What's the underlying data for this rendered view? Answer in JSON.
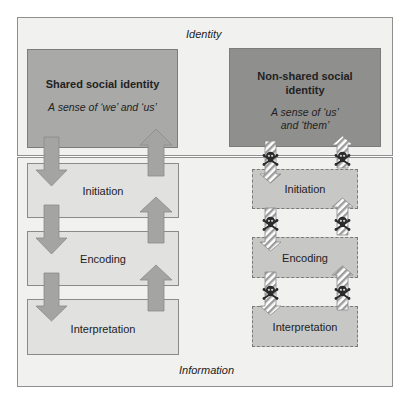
{
  "identity_frame": {
    "label": "Identity"
  },
  "shared": {
    "title": "Shared social identity",
    "subtitle": "A sense of ‘we’ and ‘us’",
    "fill": "#a9a9a8"
  },
  "non_shared": {
    "title_line1": "Non-shared social",
    "title_line2": "identity",
    "subtitle_line1": "A sense of ‘us’",
    "subtitle_line2": "and ‘them’",
    "fill": "#8f8f8e"
  },
  "information_frame": {
    "label": "Information"
  },
  "left_stages": [
    {
      "label": "Initiation"
    },
    {
      "label": "Encoding"
    },
    {
      "label": "Interpretation"
    }
  ],
  "right_stages": [
    {
      "label": "Initiation"
    },
    {
      "label": "Encoding"
    },
    {
      "label": "Interpretation"
    }
  ],
  "icons": {
    "solid_arrow": "solid-gray-arrow",
    "hatched_arrow": "hatched-arrow",
    "skull": "skull-and-crossbones"
  }
}
